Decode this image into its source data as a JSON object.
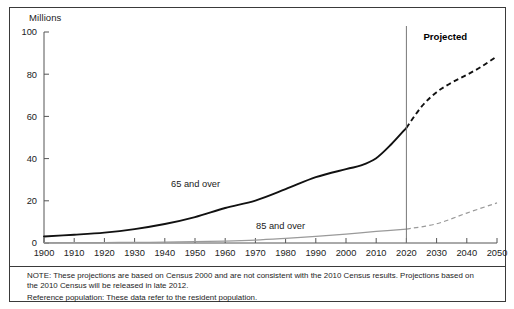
{
  "axis": {
    "y_unit_label": "Millions",
    "y_ticks": [
      "0",
      "20",
      "40",
      "60",
      "80",
      "100"
    ],
    "x_ticks": [
      "1900",
      "1910",
      "1920",
      "1930",
      "1940",
      "1950",
      "1960",
      "1970",
      "1980",
      "1990",
      "2000",
      "2010",
      "2020",
      "2030",
      "2040",
      "2050"
    ]
  },
  "annotations": {
    "projected": "Projected",
    "series_65": "65 and over",
    "series_85": "85 and over"
  },
  "note": {
    "line1": "NOTE: These projections are based on Census 2000 and are not consistent with the 2010 Census results. Projections based on",
    "line2": "the 2010 Census will be released in late 2012.",
    "line3": "Reference population: These data refer to the resident population."
  },
  "chart_data": {
    "type": "line",
    "title": "",
    "xlabel": "",
    "ylabel": "Millions",
    "xlim": [
      1900,
      2050
    ],
    "ylim": [
      0,
      100
    ],
    "grid": false,
    "legend": "inline-labels",
    "projection_divider_x": 2020,
    "series": [
      {
        "name": "65 and over",
        "color": "#111111",
        "x": [
          1900,
          1910,
          1920,
          1930,
          1940,
          1950,
          1960,
          1970,
          1980,
          1990,
          2000,
          2005,
          2010,
          2015,
          2020,
          2025,
          2030,
          2035,
          2040,
          2045,
          2050
        ],
        "values": [
          3.1,
          3.9,
          4.9,
          6.6,
          9.0,
          12.3,
          16.6,
          20.1,
          25.5,
          31.2,
          35.0,
          36.8,
          40.2,
          46.8,
          54.6,
          64.6,
          71.5,
          76.0,
          79.7,
          83.7,
          88.5
        ],
        "observed_through": 2020,
        "projected_from": 2020
      },
      {
        "name": "85 and over",
        "color": "#9a9a9a",
        "x": [
          1900,
          1910,
          1920,
          1930,
          1940,
          1950,
          1960,
          1970,
          1980,
          1990,
          2000,
          2010,
          2020,
          2030,
          2040,
          2050
        ],
        "values": [
          0.1,
          0.2,
          0.2,
          0.3,
          0.4,
          0.6,
          0.9,
          1.4,
          2.2,
          3.1,
          4.2,
          5.5,
          6.6,
          9.1,
          14.2,
          19.0
        ],
        "observed_through": 2020,
        "projected_from": 2020
      }
    ]
  }
}
